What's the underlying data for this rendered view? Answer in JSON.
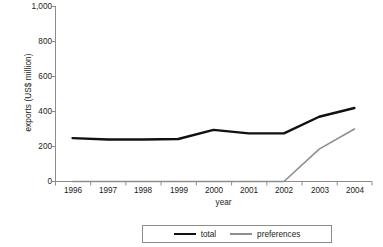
{
  "chart_data": {
    "type": "line",
    "title": "",
    "xlabel": "year",
    "ylabel": "exports (US$ million)",
    "categories": [
      "1996",
      "1997",
      "1998",
      "1999",
      "2000",
      "2001",
      "2002",
      "2003",
      "2004"
    ],
    "x": [
      1996,
      1997,
      1998,
      1999,
      2000,
      2001,
      2002,
      2003,
      2004
    ],
    "series": [
      {
        "name": "total",
        "color": "#111111",
        "line_width": 2.4,
        "values": [
          248,
          240,
          240,
          243,
          295,
          275,
          275,
          370,
          420
        ]
      },
      {
        "name": "preferences",
        "color": "#8e8e8e",
        "line_width": 1.6,
        "values": [
          0,
          0,
          0,
          0,
          0,
          0,
          0,
          185,
          300
        ]
      }
    ],
    "ylim": [
      0,
      1000
    ],
    "yticks": [
      0,
      200,
      400,
      600,
      800,
      1000
    ],
    "ytick_labels": [
      "0",
      "200",
      "400",
      "600",
      "800",
      "1,000"
    ],
    "grid": false,
    "legend_position": "bottom"
  },
  "legend": {
    "entries": [
      {
        "label": "total"
      },
      {
        "label": "preferences"
      }
    ]
  },
  "axes": {
    "axis_color": "#8c8c8c",
    "text_color": "#1a1a1a"
  }
}
